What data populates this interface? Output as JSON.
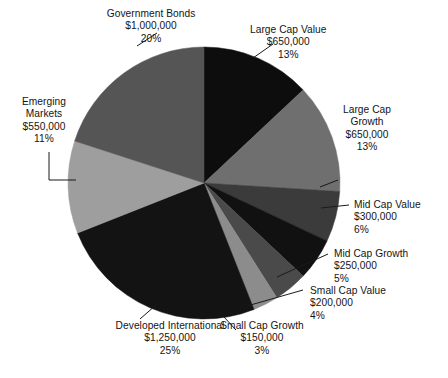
{
  "chart_data": {
    "type": "pie",
    "title": "",
    "subtitle": "",
    "xlabel": "",
    "ylabel": "",
    "legend_position": "none",
    "grid": false,
    "label_format": "name / amount / percent",
    "start_angle_deg": 0,
    "direction": "clockwise",
    "total_value": 5000000,
    "total_percent": "100%",
    "categories": [
      "Large Cap Value",
      "Large Cap Growth",
      "Mid Cap Value",
      "Mid Cap Growth",
      "Small Cap Value",
      "Small Cap Growth",
      "Developed International",
      "Emerging Markets",
      "Government Bonds"
    ],
    "values": [
      650000,
      650000,
      300000,
      250000,
      200000,
      150000,
      1250000,
      550000,
      1000000
    ],
    "percents": [
      13,
      13,
      6,
      5,
      4,
      3,
      25,
      11,
      20
    ],
    "slices": [
      {
        "key": "large-cap-value",
        "name": "Large Cap Value",
        "amount": "$650,000",
        "percent": "13%",
        "value": 650000,
        "pct": 13,
        "color": "#0d0d0d"
      },
      {
        "key": "large-cap-growth",
        "name_line1": "Large Cap",
        "name_line2": "Growth",
        "name": "Large Cap Growth",
        "amount": "$650,000",
        "percent": "13%",
        "value": 650000,
        "pct": 13,
        "color": "#6f6f6f"
      },
      {
        "key": "mid-cap-value",
        "name": "Mid Cap Value",
        "amount": "$300,000",
        "percent": "6%",
        "value": 300000,
        "pct": 6,
        "color": "#3b3b3b"
      },
      {
        "key": "mid-cap-growth",
        "name": "Mid Cap Growth",
        "amount": "$250,000",
        "percent": "5%",
        "value": 250000,
        "pct": 5,
        "color": "#111111"
      },
      {
        "key": "small-cap-value",
        "name": "Small Cap Value",
        "amount": "$200,000",
        "percent": "4%",
        "value": 200000,
        "pct": 4,
        "color": "#4a4a4a"
      },
      {
        "key": "small-cap-growth",
        "name": "Small Cap Growth",
        "amount": "$150,000",
        "percent": "3%",
        "value": 150000,
        "pct": 3,
        "color": "#8c8c8c"
      },
      {
        "key": "developed-international",
        "name_line1": "Developed International",
        "name": "Developed International",
        "amount": "$1,250,000",
        "percent": "25%",
        "value": 1250000,
        "pct": 25,
        "color": "#131313"
      },
      {
        "key": "emerging-markets",
        "name_line1": "Emerging",
        "name_line2": "Markets",
        "name": "Emerging Markets",
        "amount": "$550,000",
        "percent": "11%",
        "value": 550000,
        "pct": 11,
        "color": "#9e9e9e"
      },
      {
        "key": "government-bonds",
        "name": "Government Bonds",
        "amount": "$1,000,000",
        "percent": "20%",
        "value": 1000000,
        "pct": 20,
        "color": "#555555"
      }
    ],
    "geometry": {
      "center_x": 204,
      "center_y": 183,
      "radius": 136
    },
    "colors": {
      "background": "#ffffff",
      "text": "#141414",
      "leader_line": "#1a1a1a"
    }
  }
}
